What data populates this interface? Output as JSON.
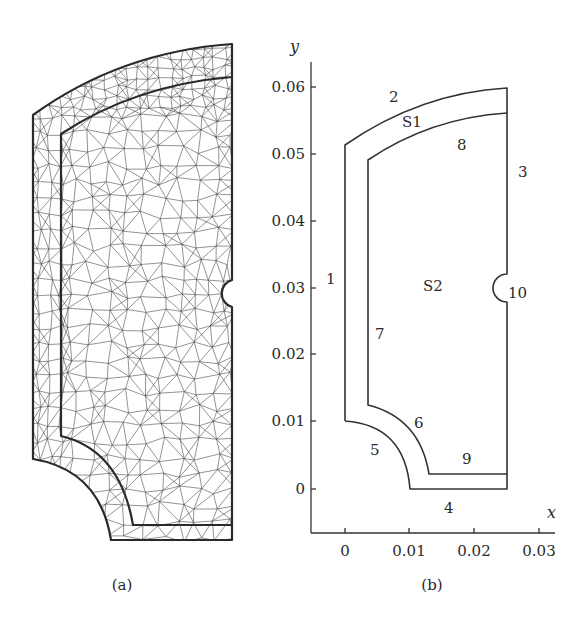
{
  "panel_a": {
    "caption": "(a)",
    "description": "Triangular finite element mesh of domain"
  },
  "panel_b": {
    "caption": "(b)",
    "axes": {
      "x_label": "x",
      "y_label": "y",
      "x_ticks": [
        "0",
        "0.01",
        "0.02",
        "0.03"
      ],
      "y_ticks": [
        "0",
        "0.01",
        "0.02",
        "0.03",
        "0.04",
        "0.05",
        "0.06"
      ]
    },
    "subdomains": [
      "S1",
      "S2"
    ],
    "boundary_labels": [
      "1",
      "2",
      "3",
      "4",
      "5",
      "6",
      "7",
      "8",
      "9",
      "10"
    ]
  },
  "chart_data": {
    "type": "diagram",
    "title": "",
    "xlabel": "x",
    "ylabel": "y",
    "xlim": [
      -0.005,
      0.031
    ],
    "ylim": [
      -0.006,
      0.063
    ],
    "x_ticks": [
      0,
      0.01,
      0.02,
      0.03
    ],
    "y_ticks": [
      0,
      0.01,
      0.02,
      0.03,
      0.04,
      0.05,
      0.06
    ],
    "subdomains": [
      {
        "name": "S1",
        "description": "outer layer band",
        "label_pos": [
          0.01,
          0.055
        ]
      },
      {
        "name": "S2",
        "description": "inner core region",
        "label_pos": [
          0.0135,
          0.0305
        ]
      }
    ],
    "boundaries": [
      {
        "id": "1",
        "description": "outer left edge x=0, y 0.01 to 0.051",
        "label_pos": [
          -0.002,
          0.032
        ]
      },
      {
        "id": "2",
        "description": "outer top arc from (0,0.0515) to (0.025,0.06)",
        "label_pos": [
          0.007,
          0.058
        ]
      },
      {
        "id": "3",
        "description": "right edge x=0.025",
        "label_pos": [
          0.027,
          0.048
        ]
      },
      {
        "id": "4",
        "description": "outer bottom edge y=0 from x 0.01 to 0.025",
        "label_pos": [
          0.016,
          -0.004
        ]
      },
      {
        "id": "5",
        "description": "outer quarter arc from (0,0.01) to (0.01,0)",
        "label_pos": [
          0.0045,
          0.006
        ]
      },
      {
        "id": "6",
        "description": "inner quarter arc",
        "label_pos": [
          0.011,
          0.01
        ]
      },
      {
        "id": "7",
        "description": "inner left edge x~0.0035",
        "label_pos": [
          0.0055,
          0.0215
        ]
      },
      {
        "id": "8",
        "description": "inner top arc",
        "label_pos": [
          0.018,
          0.0525
        ]
      },
      {
        "id": "9",
        "description": "inner bottom edge y~0.002",
        "label_pos": [
          0.0185,
          0.0055
        ]
      },
      {
        "id": "10",
        "description": "semicircular notch on right edge at y~0.03",
        "label_pos": [
          0.0265,
          0.0295
        ]
      }
    ]
  }
}
